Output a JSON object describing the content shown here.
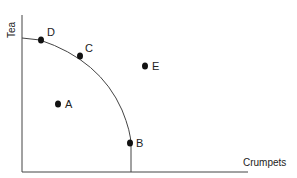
{
  "diagram": {
    "type": "production-possibilities-frontier",
    "x_axis_label": "Crumpets",
    "y_axis_label": "Tea",
    "points": [
      {
        "label": "D",
        "x": 40,
        "y": 40,
        "position": "on-curve"
      },
      {
        "label": "C",
        "x": 80,
        "y": 56,
        "position": "on-curve"
      },
      {
        "label": "E",
        "x": 146,
        "y": 66,
        "position": "outside"
      },
      {
        "label": "A",
        "x": 58,
        "y": 104,
        "position": "inside"
      },
      {
        "label": "B",
        "x": 131,
        "y": 143,
        "position": "on-curve"
      }
    ],
    "colors": {
      "line": "#444444",
      "point": "#111111",
      "text": "#222222"
    }
  }
}
